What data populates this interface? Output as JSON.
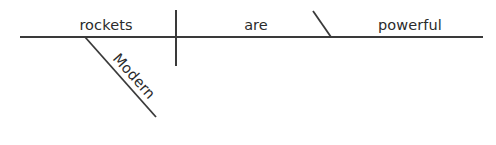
{
  "diagram": {
    "type": "reed-kellogg-sentence-diagram",
    "sentence": "Modern rockets are powerful.",
    "canvas": {
      "width": 496,
      "height": 145,
      "background": "#ffffff"
    },
    "stroke_color": "#3a3a3a",
    "text_color": "#2b2b2b",
    "baseline": {
      "label": "baseline",
      "x1": 20,
      "y1": 37,
      "x2": 483,
      "y2": 37
    },
    "subject_predicate_divider": {
      "label": "subject-predicate-divider",
      "x1": 176,
      "y1": 10,
      "x2": 176,
      "y2": 66
    },
    "complement_divider": {
      "label": "predicate-complement-divider",
      "x1": 313,
      "y1": 11,
      "x2": 331,
      "y2": 37
    },
    "modifier_line": {
      "label": "modifier-slant-line",
      "x1": 85,
      "y1": 37,
      "x2": 156,
      "y2": 117
    },
    "words": [
      {
        "id": "subject",
        "text": "rockets",
        "role": "subject",
        "x": 106,
        "y": 30,
        "anchor": "middle",
        "rotation": 0
      },
      {
        "id": "verb",
        "text": "are",
        "role": "linking-verb",
        "x": 256,
        "y": 30,
        "anchor": "middle",
        "rotation": 0
      },
      {
        "id": "complement",
        "text": "powerful",
        "role": "predicate-adjective",
        "x": 410,
        "y": 30,
        "anchor": "middle",
        "rotation": 0
      },
      {
        "id": "modifier",
        "text": "Modern",
        "role": "adjective-modifier",
        "x": 112,
        "y": 59,
        "anchor": "start",
        "rotation": 48
      }
    ]
  }
}
